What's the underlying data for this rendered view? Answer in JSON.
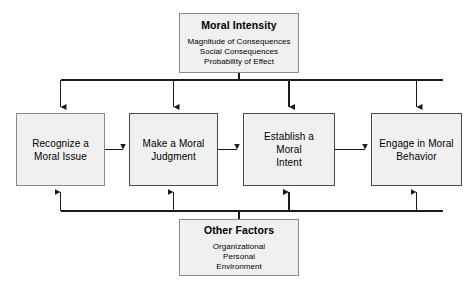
{
  "figure": {
    "type": "flow-diagram",
    "caption": "",
    "background_color": "#ffffff",
    "box_fill_color": "#f0f0f0",
    "box_border_color": "#8a8a8a",
    "connector_color": "#1a1a1a"
  },
  "influences": {
    "top": {
      "title": "Moral Intensity",
      "items": [
        "Magnitude of Consequences",
        "Social Consequences",
        "Probability of Effect"
      ]
    },
    "bottom": {
      "title": "Other Factors",
      "items": [
        "Organizational",
        "Personal",
        "Environment"
      ]
    }
  },
  "process": {
    "steps": [
      {
        "line1": "Recognize a",
        "line2": "Moral Issue"
      },
      {
        "line1": "Make a Moral",
        "line2": "Judgment"
      },
      {
        "line1": "Establish a Moral",
        "line2": "Intent"
      },
      {
        "line1": "Engage in Moral",
        "line2": "Behavior"
      }
    ]
  }
}
